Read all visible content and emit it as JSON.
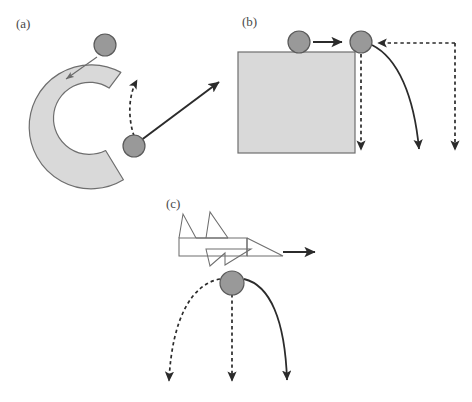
{
  "figure": {
    "background_color": "#ffffff",
    "width": 472,
    "height": 402,
    "stroke_color": "#555555",
    "dark_stroke_color": "#222222",
    "shape_fill_color": "#d9d9d9",
    "shape_edge_color": "#6e6e6e",
    "ball_fill_color": "#999999",
    "ball_edge_color": "#555555",
    "label_color": "#4a4a4a"
  },
  "panels": [
    {
      "id": "a",
      "label": "(a)",
      "label_x": 16,
      "label_y": 28,
      "description": "Curved C-shaped tube with ball entering and two candidate exit trajectories",
      "objects": {
        "arc": {
          "name": "curved-tube",
          "center_x": 88,
          "center_y": 125,
          "outer_radius": 62,
          "inner_radius": 36,
          "start_angle_deg": -58,
          "end_angle_deg": 125,
          "fill": "#d9d9d9",
          "edge": "#6e6e6e"
        },
        "ball_entering": {
          "name": "ball-entering",
          "cx": 105,
          "cy": 45,
          "r": 11
        },
        "ball_exiting": {
          "name": "ball-exiting",
          "cx": 134,
          "cy": 146,
          "r": 11
        },
        "entry_arrow": {
          "name": "entry-arrow",
          "style": "thin-solid",
          "from_x": 97,
          "from_y": 56,
          "to_x": 65,
          "to_y": 79
        },
        "dashed_curved_exit": {
          "name": "dashed-curved-exit-arrow",
          "style": "dashed-curved",
          "from_x": 134,
          "from_y": 137,
          "to_x": 139,
          "to_y": 74
        },
        "solid_straight_exit": {
          "name": "solid-straight-exit-arrow",
          "style": "thick-solid-straight",
          "from_x": 139,
          "from_y": 142,
          "to_x": 222,
          "to_y": 80
        }
      }
    },
    {
      "id": "b",
      "label": "(b)",
      "label_x": 242,
      "label_y": 26,
      "description": "Ball rolling off a table edge, with straight-down dashed path and curved solid path",
      "objects": {
        "block": {
          "name": "table-block",
          "x": 238,
          "y": 52,
          "width": 117,
          "height": 101,
          "fill": "#d9d9d9",
          "edge": "#6e6e6e"
        },
        "ball_on_block": {
          "name": "ball-on-block",
          "cx": 299,
          "cy": 42,
          "r": 11
        },
        "ball_at_edge": {
          "name": "ball-at-edge",
          "cx": 361,
          "cy": 42,
          "r": 11
        },
        "motion_arrow": {
          "name": "rolling-motion-arrow",
          "style": "thick-solid-straight",
          "from_x": 313,
          "from_y": 42,
          "to_x": 345,
          "to_y": 42
        },
        "dashed_horizontal_pointer": {
          "name": "dashed-horizontal-pointer",
          "style": "dashed-straight",
          "from_x": 455,
          "from_y": 43,
          "to_x": 375,
          "to_y": 43
        },
        "dashed_vertical_at_edge": {
          "name": "dashed-vertical-drop-at-edge",
          "style": "dashed-straight",
          "from_x": 361,
          "from_y": 55,
          "to_x": 361,
          "to_y": 152
        },
        "solid_curved_fall": {
          "name": "solid-curved-fall-arrow",
          "style": "solid-curved",
          "from_x": 372,
          "from_y": 44,
          "to_x": 420,
          "to_y": 152
        },
        "dashed_vertical_far_right": {
          "name": "dashed-vertical-drop-far-right",
          "style": "dashed-straight",
          "from_x": 455,
          "from_y": 43,
          "to_x": 455,
          "to_y": 152
        }
      }
    },
    {
      "id": "c",
      "label": "(c)",
      "label_x": 166,
      "label_y": 208,
      "description": "Airplane in flight dropping a ball, with three candidate fall trajectories",
      "objects": {
        "airplane": {
          "name": "airplane-wireframe",
          "fill": "none",
          "edge": "#6e6e6e"
        },
        "flight_arrow": {
          "name": "flight-direction-arrow",
          "style": "thick-solid-straight",
          "from_x": 283,
          "from_y": 252,
          "to_x": 318,
          "to_y": 252
        },
        "ball_dropped": {
          "name": "ball-dropped",
          "cx": 232,
          "cy": 283,
          "r": 12
        },
        "dashed_backward_curve": {
          "name": "dashed-backward-curve-arrow",
          "style": "dashed-curved",
          "from_x": 221,
          "from_y": 278,
          "to_x": 170,
          "to_y": 385
        },
        "dashed_straight_down": {
          "name": "dashed-straight-down-arrow",
          "style": "dashed-straight",
          "from_x": 232,
          "from_y": 295,
          "to_x": 232,
          "to_y": 385
        },
        "solid_forward_curve": {
          "name": "solid-forward-curve-arrow",
          "style": "solid-curved",
          "from_x": 243,
          "from_y": 278,
          "to_x": 288,
          "to_y": 385
        }
      }
    }
  ]
}
